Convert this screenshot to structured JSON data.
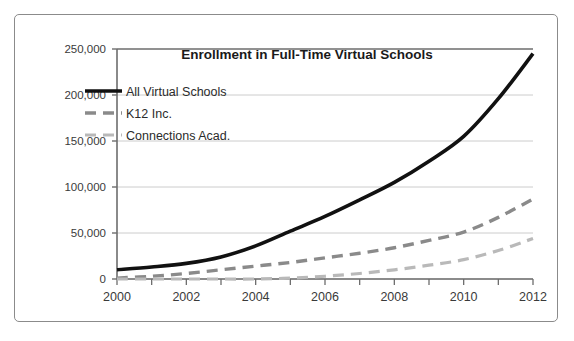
{
  "chart_data": {
    "type": "line",
    "title": "Enrollment in Full-Time Virtual Schools",
    "xlabel": "",
    "ylabel": "",
    "x": [
      2000,
      2001,
      2002,
      2003,
      2004,
      2005,
      2006,
      2007,
      2008,
      2009,
      2010,
      2011,
      2012
    ],
    "xlim": [
      2000,
      2012
    ],
    "ylim": [
      0,
      250000
    ],
    "yticks": [
      0,
      50000,
      100000,
      150000,
      200000,
      250000
    ],
    "ytick_labels": [
      "0",
      "50,000",
      "100,000",
      "150,000",
      "200,000",
      "250,000"
    ],
    "xticks": [
      2000,
      2001,
      2002,
      2003,
      2004,
      2005,
      2006,
      2007,
      2008,
      2009,
      2010,
      2011,
      2012
    ],
    "xtick_labels_shown": [
      "2000",
      "2002",
      "2004",
      "2006",
      "2008",
      "2010",
      "2012"
    ],
    "xtick_label_values": [
      2000,
      2002,
      2004,
      2006,
      2008,
      2010,
      2012
    ],
    "grid": true,
    "grid_axis": "y",
    "legend_position": "upper-left-inside",
    "series": [
      {
        "name": "All Virtual Schools",
        "style": "solid",
        "color": "#111111",
        "width": 3.6,
        "values": [
          10000,
          13000,
          17000,
          24000,
          36000,
          52000,
          68000,
          86000,
          105000,
          128000,
          155000,
          196000,
          245000
        ]
      },
      {
        "name": "K12 Inc.",
        "style": "dashed",
        "color": "#8a8a8a",
        "width": 3.4,
        "values": [
          1000,
          3000,
          6000,
          10000,
          14000,
          18000,
          23000,
          28000,
          34000,
          42000,
          51000,
          67000,
          87000
        ]
      },
      {
        "name": "Connections Acad.",
        "style": "dashed",
        "color": "#b9b9b9",
        "width": 3.2,
        "values": [
          0,
          0,
          0,
          0,
          0,
          1000,
          3000,
          6000,
          10000,
          15000,
          21000,
          31000,
          44000
        ]
      }
    ]
  },
  "legend": {
    "items": [
      {
        "label": "All Virtual Schools"
      },
      {
        "label": "K12 Inc."
      },
      {
        "label": "Connections Acad."
      }
    ]
  }
}
